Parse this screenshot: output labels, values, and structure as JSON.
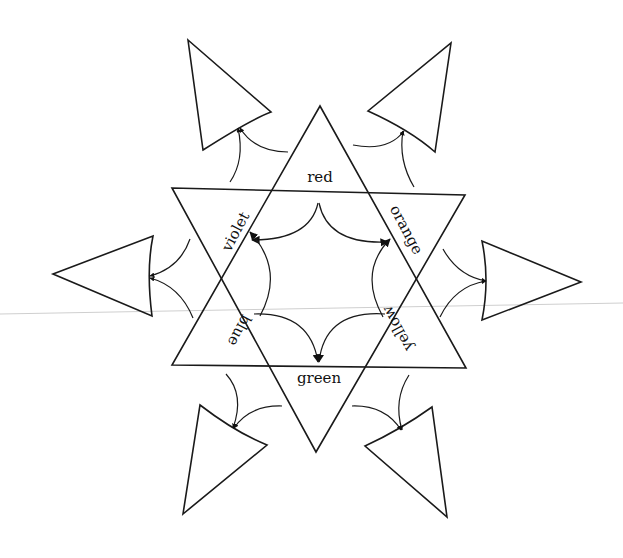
{
  "diagram": {
    "title": "",
    "center_star": {
      "labels": {
        "top": "red",
        "upper_right": "orange",
        "lower_right": "yellow",
        "bottom": "green",
        "lower_left": "blue",
        "upper_left": "violet"
      }
    },
    "outer_triangles": [
      {
        "position": "upper-left",
        "pointing": "up-left"
      },
      {
        "position": "upper-right",
        "pointing": "up-right"
      },
      {
        "position": "left",
        "pointing": "left"
      },
      {
        "position": "right",
        "pointing": "right"
      },
      {
        "position": "lower-left",
        "pointing": "down-left"
      },
      {
        "position": "lower-right",
        "pointing": "down-right"
      }
    ],
    "colors": {
      "stroke": "#1a1a1a",
      "background": "#ffffff"
    }
  }
}
